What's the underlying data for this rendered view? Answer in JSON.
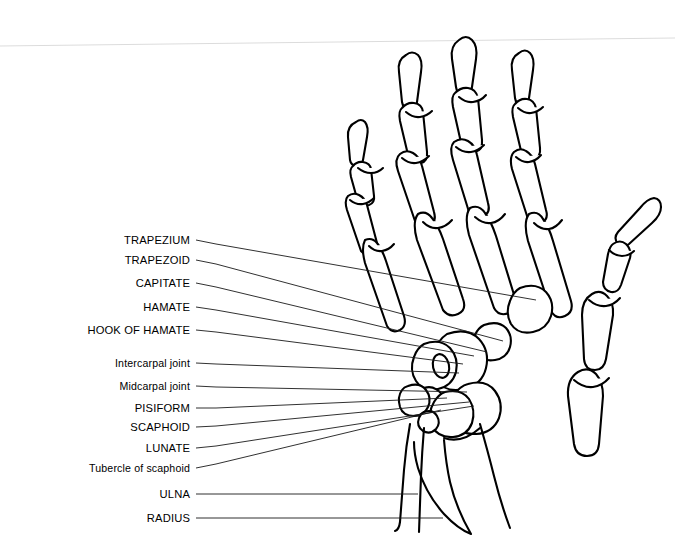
{
  "figure": {
    "view": "anterior/palmar view of right hand bones with carpal labels",
    "background_color": "#ffffff",
    "ink_color": "#000000",
    "scan_line_color": "#d8d8d8",
    "leader_color": "#1a1a1a"
  },
  "labels": [
    {
      "id": "trapezium",
      "text": "TRAPEZIUM",
      "case": "caps",
      "text_x": 190,
      "text_y": 240,
      "leader": [
        [
          196,
          240
        ],
        [
          216,
          244
        ],
        [
          536,
          300
        ]
      ]
    },
    {
      "id": "trapezoid",
      "text": "TRAPEZOID",
      "case": "caps",
      "text_x": 190,
      "text_y": 260,
      "leader": [
        [
          196,
          260
        ],
        [
          216,
          264
        ],
        [
          503,
          341
        ]
      ]
    },
    {
      "id": "capitate",
      "text": "CAPITATE",
      "case": "caps",
      "text_x": 190,
      "text_y": 283,
      "leader": [
        [
          196,
          283
        ],
        [
          216,
          287
        ],
        [
          487,
          352
        ]
      ]
    },
    {
      "id": "hamate",
      "text": "HAMATE",
      "case": "caps",
      "text_x": 190,
      "text_y": 307,
      "leader": [
        [
          196,
          307
        ],
        [
          216,
          310
        ],
        [
          474,
          356
        ]
      ]
    },
    {
      "id": "hook-of-hamate",
      "text": "HOOK OF HAMATE",
      "case": "caps",
      "text_x": 190,
      "text_y": 330,
      "leader": [
        [
          196,
          330
        ],
        [
          216,
          332
        ],
        [
          463,
          364
        ]
      ]
    },
    {
      "id": "intercarpal-joint",
      "text": "Intercarpal joint",
      "case": "mixed",
      "text_x": 190,
      "text_y": 363,
      "leader": [
        [
          196,
          363
        ],
        [
          216,
          364
        ],
        [
          459,
          373
        ]
      ]
    },
    {
      "id": "midcarpal-joint",
      "text": "Midcarpal joint",
      "case": "mixed",
      "text_x": 190,
      "text_y": 386,
      "leader": [
        [
          196,
          386
        ],
        [
          216,
          387
        ],
        [
          467,
          392
        ]
      ]
    },
    {
      "id": "pisiform",
      "text": "PISIFORM",
      "case": "caps",
      "text_x": 190,
      "text_y": 408,
      "leader": [
        [
          196,
          408
        ],
        [
          216,
          408
        ],
        [
          447,
          398
        ]
      ]
    },
    {
      "id": "scaphoid",
      "text": "SCAPHOID",
      "case": "caps",
      "text_x": 190,
      "text_y": 427,
      "leader": [
        [
          196,
          427
        ],
        [
          216,
          426
        ],
        [
          469,
          402
        ]
      ]
    },
    {
      "id": "lunate",
      "text": "LUNATE",
      "case": "caps",
      "text_x": 190,
      "text_y": 448,
      "leader": [
        [
          196,
          448
        ],
        [
          216,
          446
        ],
        [
          474,
          406
        ]
      ]
    },
    {
      "id": "tubercle-of-scaphoid",
      "text": "Tubercle of scaphoid",
      "case": "mixed",
      "text_x": 190,
      "text_y": 468,
      "leader": [
        [
          196,
          468
        ],
        [
          216,
          464
        ],
        [
          441,
          410
        ]
      ]
    },
    {
      "id": "ulna",
      "text": "ULNA",
      "case": "caps",
      "text_x": 190,
      "text_y": 494,
      "leader": [
        [
          196,
          494
        ],
        [
          418,
          494
        ]
      ]
    },
    {
      "id": "radius",
      "text": "RADIUS",
      "case": "caps",
      "text_x": 190,
      "text_y": 518,
      "leader": [
        [
          196,
          518
        ],
        [
          443,
          518
        ]
      ]
    }
  ],
  "anatomy_groups": [
    {
      "id": "digit-2-index",
      "name": "index finger phalanges and metacarpal"
    },
    {
      "id": "digit-3-middle",
      "name": "middle finger phalanges and metacarpal"
    },
    {
      "id": "digit-4-ring",
      "name": "ring finger phalanges and metacarpal"
    },
    {
      "id": "digit-5-little",
      "name": "little finger phalanges and metacarpal"
    },
    {
      "id": "digit-1-thumb",
      "name": "thumb phalanges and first metacarpal"
    },
    {
      "id": "carpus",
      "name": "carpal bones"
    },
    {
      "id": "forearm",
      "name": "distal radius and ulna"
    }
  ]
}
